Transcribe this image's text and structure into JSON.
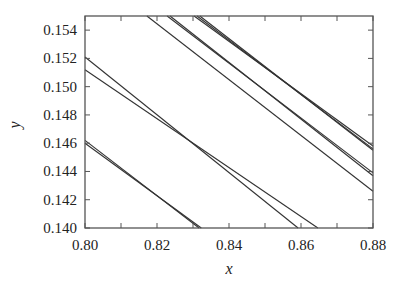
{
  "chart_data": {
    "type": "line",
    "title": "",
    "xlabel": "x",
    "ylabel": "y",
    "xlim": [
      0.8,
      0.88
    ],
    "ylim": [
      0.14,
      0.155
    ],
    "x_ticks": [
      "0.80",
      "0.82",
      "0.84",
      "0.86",
      "0.88"
    ],
    "y_ticks": [
      "0.140",
      "0.142",
      "0.144",
      "0.146",
      "0.148",
      "0.150",
      "0.152",
      "0.154"
    ],
    "x_tick_values": [
      0.8,
      0.82,
      0.84,
      0.86,
      0.88
    ],
    "y_tick_values": [
      0.14,
      0.142,
      0.144,
      0.146,
      0.148,
      0.15,
      0.152,
      0.154
    ],
    "x_minor_ticks": [
      0.81,
      0.83,
      0.85,
      0.87
    ],
    "grid": false,
    "legend": null,
    "line_color": "#333333",
    "series": [
      {
        "name": "line-a1",
        "x": [
          0.8,
          0.8317
        ],
        "y": [
          0.1462,
          0.14
        ]
      },
      {
        "name": "line-a2",
        "x": [
          0.8,
          0.8323
        ],
        "y": [
          0.146,
          0.14
        ]
      },
      {
        "name": "line-b1",
        "x": [
          0.8,
          0.8592
        ],
        "y": [
          0.1521,
          0.14
        ]
      },
      {
        "name": "line-b2",
        "x": [
          0.8,
          0.8647
        ],
        "y": [
          0.1512,
          0.14
        ]
      },
      {
        "name": "line-c0",
        "x": [
          0.8172,
          0.88
        ],
        "y": [
          0.155,
          0.1426
        ]
      },
      {
        "name": "line-c1",
        "x": [
          0.8228,
          0.88
        ],
        "y": [
          0.155,
          0.1439
        ]
      },
      {
        "name": "line-c2",
        "x": [
          0.8236,
          0.88
        ],
        "y": [
          0.155,
          0.1437
        ]
      },
      {
        "name": "line-d1",
        "x": [
          0.8303,
          0.88
        ],
        "y": [
          0.155,
          0.1458
        ]
      },
      {
        "name": "line-d2",
        "x": [
          0.8311,
          0.88
        ],
        "y": [
          0.155,
          0.1456
        ]
      },
      {
        "name": "line-d3",
        "x": [
          0.8319,
          0.88
        ],
        "y": [
          0.155,
          0.1455
        ]
      }
    ]
  }
}
